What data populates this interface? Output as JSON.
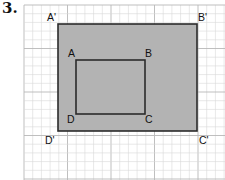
{
  "problem": {
    "number": "3."
  },
  "grid": {
    "x0": 24,
    "y0": 5,
    "x1": 225,
    "y1": 180,
    "cell": 8.7,
    "minor_color": "#d9d9d9",
    "major_color": "#b8b8b8"
  },
  "outer_rectangle": {
    "name": "A'B'C'D'",
    "x": 58,
    "y": 24,
    "width": 139,
    "height": 107,
    "fill": "#b3b3b3",
    "stroke": "#2b2b2b",
    "vertices": [
      {
        "label": "A'",
        "x": 47,
        "y": 21
      },
      {
        "label": "B'",
        "x": 198,
        "y": 21
      },
      {
        "label": "C'",
        "x": 199,
        "y": 144
      },
      {
        "label": "D'",
        "x": 45,
        "y": 144
      }
    ]
  },
  "inner_rectangle": {
    "name": "ABCD",
    "x": 76,
    "y": 60,
    "width": 69,
    "height": 54,
    "fill": "#b3b3b3",
    "stroke": "#2b2b2b",
    "vertices": [
      {
        "label": "A",
        "x": 68,
        "y": 57
      },
      {
        "label": "B",
        "x": 145,
        "y": 57
      },
      {
        "label": "C",
        "x": 145,
        "y": 123
      },
      {
        "label": "D",
        "x": 67,
        "y": 123
      }
    ]
  }
}
